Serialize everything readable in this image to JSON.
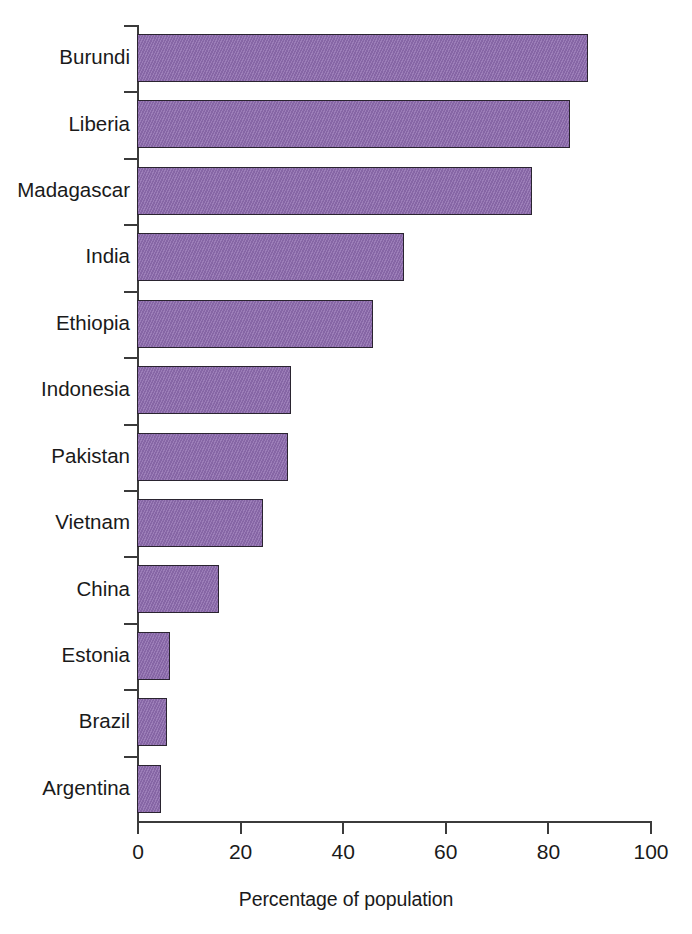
{
  "chart_data": {
    "type": "bar",
    "orientation": "horizontal",
    "title": "",
    "xlabel": "Percentage of population",
    "ylabel": "",
    "xlim": [
      0,
      100
    ],
    "xticks": [
      "0",
      "20",
      "40",
      "60",
      "80",
      "100"
    ],
    "xtick_values": [
      0,
      20,
      40,
      60,
      80,
      100
    ],
    "grid": false,
    "legend": null,
    "bar_color": "#8d6bae",
    "bar_edge_color": "#2a2430",
    "background_color": "#ffffff",
    "categories": [
      "Burundi",
      "Liberia",
      "Madagascar",
      "India",
      "Ethiopia",
      "Indonesia",
      "Pakistan",
      "Vietnam",
      "China",
      "Estonia",
      "Brazil",
      "Argentina"
    ],
    "values": [
      88,
      84.4,
      77,
      52,
      46,
      30,
      29.5,
      24.5,
      16,
      6.5,
      5.8,
      4.7
    ]
  }
}
